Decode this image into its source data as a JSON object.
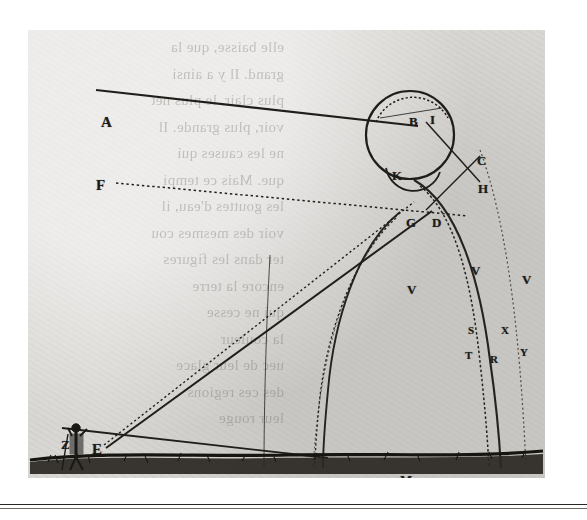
{
  "plate": {
    "title": "Descartes rainbow refraction diagram",
    "caption": "",
    "paper_color": "#d9d7d3",
    "ink_color": "#1d1b18"
  },
  "bleed_text": "elle baisse, que la\ngrand. Il y a ainsi\nplus clair, le plus net\nvoir, plus grande. Il\nne les causes qui\nque. Mais ce tempi\nles gouttes d'eau, il\nvoir des mesmes cou\nter dans les figures\nencore la terre\nqui ne cesse\nla couleur\nuec de leur glace\ndes ces regions\nleur rouge",
  "labels": [
    {
      "id": "A",
      "text": "A",
      "x": 73,
      "y": 85,
      "size": "lg",
      "role": "incident-ray-origin"
    },
    {
      "id": "F",
      "text": "F",
      "x": 68,
      "y": 148,
      "size": "lg",
      "role": "secondary-ray-origin"
    },
    {
      "id": "Z",
      "text": "Z",
      "x": 33,
      "y": 408,
      "size": "md",
      "role": "horizon-left-marker"
    },
    {
      "id": "E",
      "text": "E",
      "x": 64,
      "y": 412,
      "size": "lg",
      "role": "observer-eye-point"
    },
    {
      "id": "B",
      "text": "B",
      "x": 381,
      "y": 85,
      "size": "md",
      "role": "droplet-entry-point"
    },
    {
      "id": "I",
      "text": "I",
      "x": 402,
      "y": 83,
      "size": "md",
      "role": "droplet-top-point"
    },
    {
      "id": "K",
      "text": "K",
      "x": 364,
      "y": 139,
      "size": "md",
      "role": "droplet-left-point"
    },
    {
      "id": "C",
      "text": "C",
      "x": 449,
      "y": 124,
      "size": "md",
      "role": "droplet-right-point"
    },
    {
      "id": "H",
      "text": "H",
      "x": 450,
      "y": 152,
      "size": "md",
      "role": "droplet-exit-point"
    },
    {
      "id": "G",
      "text": "G",
      "x": 378,
      "y": 186,
      "size": "md",
      "role": "droplet-lower-left-point"
    },
    {
      "id": "D",
      "text": "D",
      "x": 404,
      "y": 186,
      "size": "md",
      "role": "droplet-bottom-point"
    },
    {
      "id": "V1",
      "text": "V",
      "x": 379,
      "y": 253,
      "size": "md",
      "role": "primary-bow-band"
    },
    {
      "id": "V2",
      "text": "V",
      "x": 443,
      "y": 234,
      "size": "md",
      "role": "primary-bow-band"
    },
    {
      "id": "V3",
      "text": "V",
      "x": 494,
      "y": 243,
      "size": "md",
      "role": "secondary-bow-band"
    },
    {
      "id": "S",
      "text": "S",
      "x": 440,
      "y": 295,
      "size": "sm",
      "role": "bow-arc-marker"
    },
    {
      "id": "X",
      "text": "X",
      "x": 473,
      "y": 295,
      "size": "sm",
      "role": "bow-arc-marker"
    },
    {
      "id": "T",
      "text": "T",
      "x": 437,
      "y": 320,
      "size": "sm",
      "role": "bow-arc-marker"
    },
    {
      "id": "R",
      "text": "R",
      "x": 462,
      "y": 324,
      "size": "sm",
      "role": "bow-arc-marker"
    },
    {
      "id": "Y",
      "text": "Y",
      "x": 492,
      "y": 317,
      "size": "sm",
      "role": "bow-arc-marker"
    },
    {
      "id": "M",
      "text": "M",
      "x": 372,
      "y": 443,
      "size": "md",
      "role": "ground-point-marker"
    },
    {
      "id": "Tg",
      "text": "T",
      "x": 432,
      "y": 462,
      "size": "sm",
      "role": "ground-foot-marker"
    },
    {
      "id": "Sg",
      "text": "S",
      "x": 446,
      "y": 461,
      "size": "sm",
      "role": "ground-foot-marker"
    },
    {
      "id": "Rg",
      "text": "R",
      "x": 457,
      "y": 461,
      "size": "sm",
      "role": "ground-foot-marker"
    },
    {
      "id": "Vg",
      "text": "V",
      "x": 468,
      "y": 455,
      "size": "sm",
      "role": "ground-foot-marker"
    },
    {
      "id": "Xg",
      "text": "X",
      "x": 472,
      "y": 464,
      "size": "sm",
      "role": "ground-foot-marker"
    },
    {
      "id": "Yg",
      "text": "Y",
      "x": 506,
      "y": 458,
      "size": "sm",
      "role": "ground-foot-marker"
    }
  ],
  "figure": {
    "observer_name": "standing-observer",
    "observer_x": 76,
    "observer_y": 425
  },
  "chart_data": {
    "type": "diagram",
    "elements": [
      {
        "name": "incident-ray-A",
        "from": "A",
        "to": "B",
        "style": "solid"
      },
      {
        "name": "incident-ray-F",
        "from": "F",
        "to": "H",
        "style": "dotted"
      },
      {
        "name": "sight-ray-solid",
        "from": "E",
        "to": "D",
        "style": "solid"
      },
      {
        "name": "sight-ray-dotted",
        "from": "E",
        "to": "G",
        "style": "dotted"
      },
      {
        "name": "horizon-line",
        "from": "Z",
        "to": "ground-right",
        "style": "solid"
      },
      {
        "name": "droplet-circle",
        "center": [
          410,
          133
        ],
        "radius": 44
      },
      {
        "name": "droplet-inner-arc",
        "center": [
          408,
          140
        ],
        "radius": 36
      },
      {
        "name": "droplet-lower-lobe",
        "center": [
          403,
          170
        ],
        "radius": 22
      }
    ]
  }
}
